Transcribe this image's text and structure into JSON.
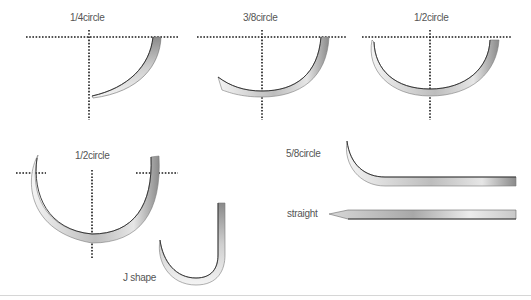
{
  "diagram": {
    "colors": {
      "background": "#ffffff",
      "guide": "#1a1a1a",
      "needle_dark": "#2a2a2a",
      "needle_mid": "#9a9a9a",
      "needle_light": "#f2f2f2",
      "label": "#555555",
      "footer_rule": "#d6d6d6"
    },
    "shapes": [
      {
        "id": "quarter-circle",
        "label": "1/4circle"
      },
      {
        "id": "three-eighths-circle",
        "label": "3/8circle"
      },
      {
        "id": "half-circle-small",
        "label": "1/2circle"
      },
      {
        "id": "half-circle-large",
        "label": "1/2circle"
      },
      {
        "id": "five-eighths-circle",
        "label": "5/8circle"
      },
      {
        "id": "straight",
        "label": "straight"
      },
      {
        "id": "j-shape",
        "label": "J shape"
      }
    ]
  }
}
